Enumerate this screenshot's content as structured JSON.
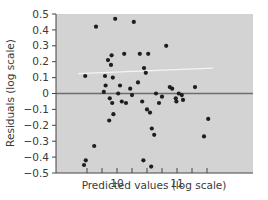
{
  "chart_data": {
    "type": "scatter",
    "title": "",
    "xlabel": "Predicted values (log scale)",
    "ylabel": "Residuals (log scale)",
    "xlim": [
      9.35,
      11.6
    ],
    "ylim": [
      -0.5,
      0.5
    ],
    "x_ticks": [
      10,
      11
    ],
    "x_tick_labels": [
      "10",
      "11"
    ],
    "x_minor_tick_step": 0.25,
    "y_ticks": [
      -0.5,
      -0.4,
      -0.3,
      -0.2,
      -0.1,
      0,
      0.1,
      0.2,
      0.3,
      0.4,
      0.5
    ],
    "y_tick_labels": [
      "−0.5",
      "−0.4",
      "−0.3",
      "−0.2",
      "−0.1",
      "0",
      "0.1",
      "0.2",
      "0.3",
      "0.4",
      "0.5"
    ],
    "grid": false,
    "legend": null,
    "reference_line": {
      "y": 0,
      "color": "#6e6e6e"
    },
    "trend_line": {
      "x": [
        9.35,
        11.6
      ],
      "y": [
        0.125,
        0.16
      ],
      "color": "#f4f4f4"
    },
    "colors": {
      "plot_bg": "#d3d3d3",
      "points": "#1e1e1e",
      "axis": "#444444",
      "text": "#3a3a3a"
    },
    "series": [
      {
        "name": "Residuals",
        "points": [
          [
            9.47,
            0.11
          ],
          [
            9.65,
            0.42
          ],
          [
            9.62,
            -0.33
          ],
          [
            9.48,
            -0.42
          ],
          [
            9.45,
            -0.45
          ],
          [
            9.8,
            0.11
          ],
          [
            9.81,
            0.05
          ],
          [
            9.85,
            0.21
          ],
          [
            9.9,
            0.18
          ],
          [
            9.91,
            0.24
          ],
          [
            9.93,
            0.1
          ],
          [
            9.78,
            0.01
          ],
          [
            9.88,
            -0.03
          ],
          [
            9.92,
            -0.06
          ],
          [
            9.87,
            -0.17
          ],
          [
            9.94,
            -0.13
          ],
          [
            9.97,
            0.47
          ],
          [
            10.05,
            0.05
          ],
          [
            10.02,
            0.0
          ],
          [
            10.08,
            -0.05
          ],
          [
            10.12,
            0.25
          ],
          [
            10.15,
            -0.06
          ],
          [
            10.22,
            0.03
          ],
          [
            10.25,
            -0.01
          ],
          [
            10.28,
            0.45
          ],
          [
            10.35,
            0.07
          ],
          [
            10.38,
            0.25
          ],
          [
            10.42,
            -0.05
          ],
          [
            10.45,
            0.16
          ],
          [
            10.48,
            0.13
          ],
          [
            10.52,
            0.25
          ],
          [
            10.5,
            -0.1
          ],
          [
            10.55,
            -0.12
          ],
          [
            10.58,
            -0.22
          ],
          [
            10.62,
            -0.26
          ],
          [
            10.44,
            -0.42
          ],
          [
            10.57,
            -0.46
          ],
          [
            10.65,
            0.0
          ],
          [
            10.7,
            -0.06
          ],
          [
            10.75,
            -0.02
          ],
          [
            10.82,
            0.3
          ],
          [
            10.88,
            0.04
          ],
          [
            10.92,
            0.03
          ],
          [
            10.98,
            -0.03
          ],
          [
            10.99,
            -0.05
          ],
          [
            11.03,
            0.0
          ],
          [
            11.08,
            -0.01
          ],
          [
            11.1,
            -0.04
          ],
          [
            11.3,
            0.04
          ],
          [
            11.45,
            -0.27
          ],
          [
            11.52,
            -0.16
          ]
        ]
      }
    ]
  }
}
